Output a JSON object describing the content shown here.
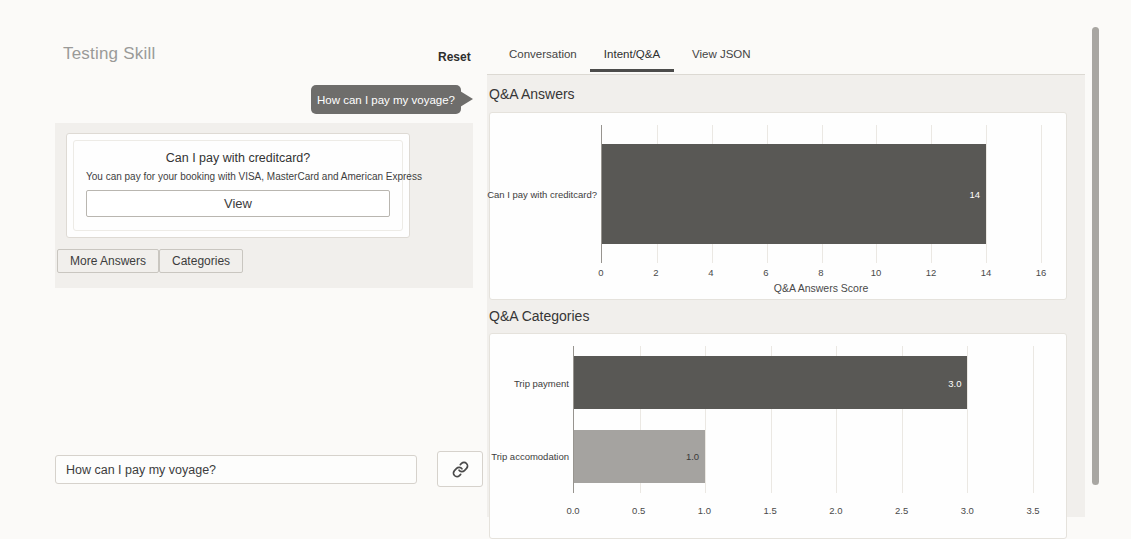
{
  "left_panel": {
    "title": "Testing Skill",
    "reset_label": "Reset",
    "user_message": "How can I pay my voyage?",
    "answer_card": {
      "title": "Can I pay with creditcard?",
      "subtitle": "You can pay for your booking with VISA, MasterCard and American Express",
      "view_label": "View"
    },
    "more_answers_label": "More Answers",
    "categories_label": "Categories",
    "input_value": "How can I pay my voyage?",
    "send_icon": "link-icon"
  },
  "right_panel": {
    "tabs": [
      {
        "label": "Conversation",
        "active": false
      },
      {
        "label": "Intent/Q&A",
        "active": true
      },
      {
        "label": "View JSON",
        "active": false
      }
    ],
    "sections": [
      {
        "heading": "Q&A Answers"
      },
      {
        "heading": "Q&A Categories"
      }
    ]
  },
  "chart_data": [
    {
      "type": "bar",
      "orientation": "horizontal",
      "title": "Q&A Answers",
      "categories": [
        "Can I pay with creditcard?"
      ],
      "values": [
        14
      ],
      "value_labels": [
        "14"
      ],
      "value_label_colors": [
        "#ffffff"
      ],
      "bar_colors": [
        "#595855"
      ],
      "xlabel": "Q&A Answers Score",
      "xlim": [
        0,
        16
      ],
      "xticks": [
        "0",
        "2",
        "4",
        "6",
        "8",
        "10",
        "12",
        "14",
        "16"
      ],
      "grid": true,
      "legend": false
    },
    {
      "type": "bar",
      "orientation": "horizontal",
      "title": "Q&A Categories",
      "categories": [
        "Trip payment",
        "Trip accomodation"
      ],
      "values": [
        3.0,
        1.0
      ],
      "value_labels": [
        "3.0",
        "1.0"
      ],
      "value_label_colors": [
        "#ffffff",
        "#3a3a3a"
      ],
      "bar_colors": [
        "#595855",
        "#a5a3a0"
      ],
      "xlabel": "",
      "xlim": [
        0,
        3.5
      ],
      "xticks": [
        "0.0",
        "0.5",
        "1.0",
        "1.5",
        "2.0",
        "2.5",
        "3.0",
        "3.5"
      ],
      "grid": true,
      "legend": false
    }
  ],
  "colors": {
    "bubble": "#6e6d6b",
    "panel_gray": "#f1efec",
    "bar_dark": "#595855",
    "bar_light": "#a5a3a0",
    "tab_underline": "#4c4c4b"
  }
}
